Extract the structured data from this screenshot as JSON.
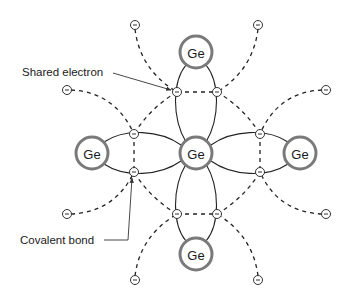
{
  "diagram": {
    "atoms": [
      {
        "id": "center",
        "label": "Ge",
        "x": 196,
        "y": 153
      },
      {
        "id": "top",
        "label": "Ge",
        "x": 196,
        "y": 52
      },
      {
        "id": "bottom",
        "label": "Ge",
        "x": 196,
        "y": 254
      },
      {
        "id": "left",
        "label": "Ge",
        "x": 92,
        "y": 153
      },
      {
        "id": "right",
        "label": "Ge",
        "x": 300,
        "y": 153
      }
    ],
    "shared_electrons": [
      {
        "x": 177,
        "y": 92
      },
      {
        "x": 217,
        "y": 92
      },
      {
        "x": 134,
        "y": 134
      },
      {
        "x": 134,
        "y": 172
      },
      {
        "x": 260,
        "y": 134
      },
      {
        "x": 260,
        "y": 172
      },
      {
        "x": 177,
        "y": 214
      },
      {
        "x": 217,
        "y": 214
      }
    ],
    "outer_electrons": [
      {
        "x": 135,
        "y": 25
      },
      {
        "x": 258,
        "y": 25
      },
      {
        "x": 67,
        "y": 90
      },
      {
        "x": 326,
        "y": 90
      },
      {
        "x": 67,
        "y": 214
      },
      {
        "x": 326,
        "y": 214
      },
      {
        "x": 135,
        "y": 280
      },
      {
        "x": 258,
        "y": 280
      }
    ],
    "electron_symbol": "−",
    "labels": {
      "shared_electron": "Shared electron",
      "covalent_bond": "Covalent bond"
    },
    "colors": {
      "atom_ring": "#7a7a7a",
      "lines": "#222222",
      "text": "#1a1a1a"
    }
  }
}
